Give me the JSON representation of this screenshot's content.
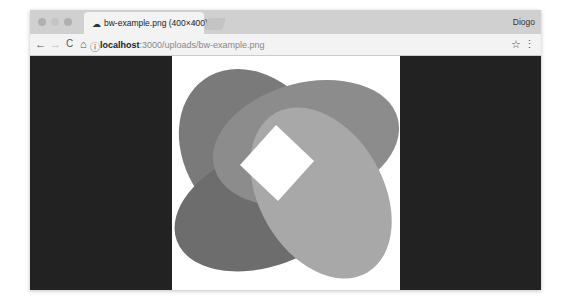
{
  "window": {
    "traffic_lights": [
      "close",
      "minimize",
      "maximize"
    ]
  },
  "tab": {
    "icon": "cloud-icon",
    "title": "bw-example.png (400×400)",
    "close": "×"
  },
  "user": {
    "name": "Diogo"
  },
  "toolbar": {
    "back": "←",
    "forward": "→",
    "reload": "C",
    "home": "⌂",
    "info": "ⓘ",
    "url_host": "localhost",
    "url_rest": ":3000/uploads/bw-example.png",
    "star": "☆",
    "menu": "⋮"
  },
  "image": {
    "alt": "grayscale interlocking ribbon knot",
    "colors": [
      "#7a7a7a",
      "#8c8c8c",
      "#a8a8a8",
      "#5e5e5e",
      "#6d6d6d"
    ]
  }
}
